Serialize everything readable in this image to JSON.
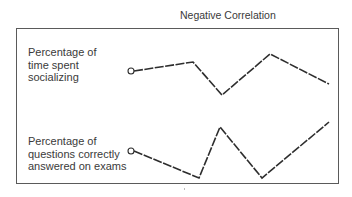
{
  "title": "Negative Correlation",
  "series": [
    {
      "label_lines": [
        "Percentage of",
        "time spent",
        "socializing"
      ],
      "points": [
        [
          131,
          71
        ],
        [
          193,
          62
        ],
        [
          222,
          95
        ],
        [
          270,
          54
        ],
        [
          329,
          84
        ]
      ]
    },
    {
      "label_lines": [
        "Percentage of",
        "questions correctly",
        "answered on exams"
      ],
      "points": [
        [
          131,
          151
        ],
        [
          199,
          178
        ],
        [
          220,
          127
        ],
        [
          262,
          178
        ],
        [
          329,
          122
        ]
      ]
    }
  ],
  "colors": {
    "line": "#2e2e2e",
    "frame": "#5a5a5a",
    "text": "#3a3a3a"
  },
  "chart_data": {
    "type": "line",
    "title": "Negative Correlation",
    "series": [
      {
        "name": "Percentage of time spent socializing",
        "values": [
          50,
          65,
          10,
          80,
          30
        ]
      },
      {
        "name": "Percentage of questions correctly answered on exams",
        "values": [
          55,
          15,
          90,
          15,
          100
        ]
      }
    ],
    "x": [
      1,
      2,
      3,
      4,
      5
    ],
    "xlabel": "",
    "ylabel": "",
    "grid": false
  }
}
